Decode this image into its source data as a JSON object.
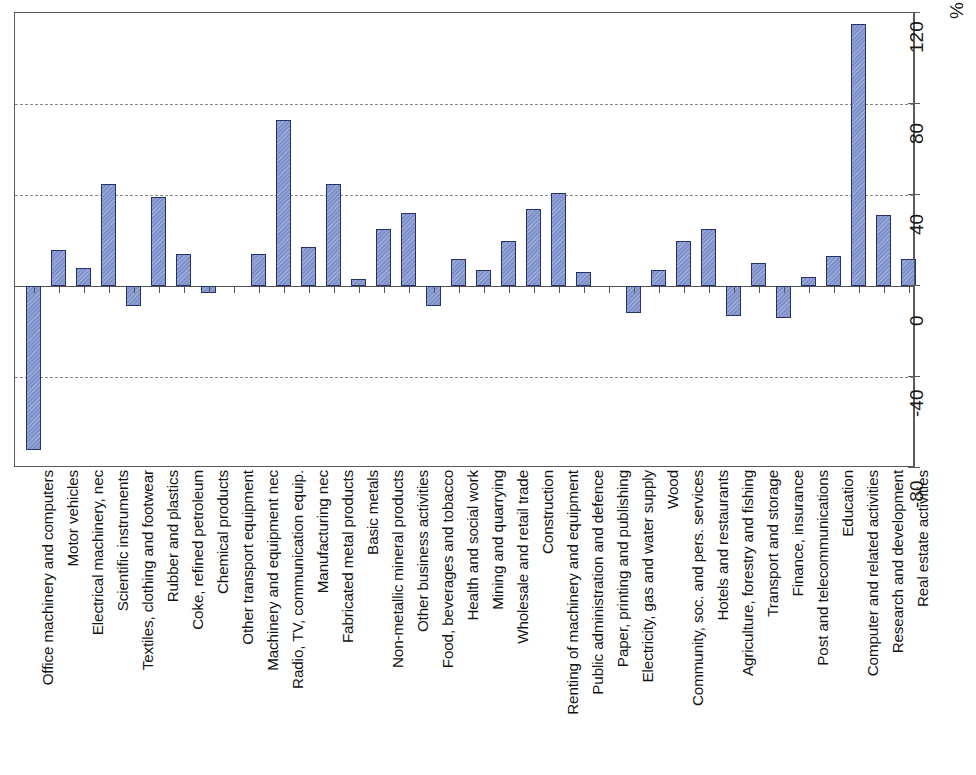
{
  "chart_data": {
    "type": "bar",
    "title": "",
    "subtitle": "",
    "xlabel": "",
    "ylabel": "%",
    "unit_label": "%",
    "orientation": "vertical",
    "grid": true,
    "legend": null,
    "ylim": [
      -80,
      120
    ],
    "ytick_values": [
      -80,
      -40,
      0,
      40,
      80,
      120
    ],
    "ytick_labels": [
      "-80",
      "-40",
      "0",
      "40",
      "80",
      "120"
    ],
    "gridline_values": [
      -40,
      40,
      80
    ],
    "zero_line_value": 0,
    "bar_fill_color": "#7f92cc",
    "bar_border_color": "#26306b",
    "axis_color": "#5a5a5a",
    "gridline_color": "#8a8a8a",
    "categories": [
      "Office machinery and computers",
      "Motor vehicles",
      "Electrical machinery, nec",
      "Scientific instruments",
      "Textiles, clothing and footwear",
      "Rubber and plastics",
      "Coke, refined petroleum",
      "Chemical products",
      "Other transport equipment",
      "Machinery and equipment nec",
      "Radio, TV, communication equip.",
      "Manufacturing nec",
      "Fabricated metal products",
      "Basic metals",
      "Non-metallic mineral products",
      "Other business activities",
      "Food, beverages and tobacco",
      "Health and social work",
      "Mining and quarrying",
      "Wholesale and retail trade",
      "Construction",
      "Renting of machinery and equipment",
      "Public administration and defence",
      "Paper, printing and publishing",
      "Electricity, gas and water supply",
      "Wood",
      "Community, soc. and pers. services",
      "Hotels and restaurants",
      "Agriculture, forestry and fishing",
      "Transport and storage",
      "Finance, insurance",
      "Post and telecommunications",
      "Education",
      "Computer and related activities",
      "Research and development",
      "Real estate activities"
    ],
    "values": [
      -72,
      16,
      8,
      45,
      -9,
      39,
      14,
      -3,
      0,
      14,
      73,
      17,
      45,
      3,
      25,
      32,
      -9,
      12,
      7,
      20,
      34,
      41,
      6,
      0,
      -12,
      7,
      20,
      25,
      -13,
      10,
      -14,
      4,
      13,
      115,
      31,
      12
    ]
  },
  "axis": {
    "unit": "%"
  }
}
